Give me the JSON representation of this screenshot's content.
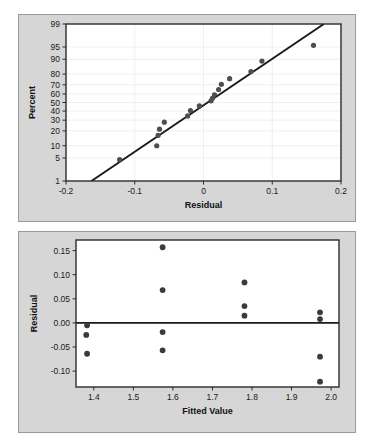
{
  "figure": {
    "background_color": "#ffffff",
    "panel_color": "#d6d6d6",
    "plot_color": "#ffffff",
    "point_color": "#4d4d53",
    "line_color": "#1a1a1a"
  },
  "chart_data": [
    {
      "type": "scatter",
      "id": "normal-probability-plot",
      "title": "",
      "xlabel": "Residual",
      "ylabel": "Percent",
      "xlim": [
        -0.2,
        0.2
      ],
      "ylim": [
        1,
        99
      ],
      "yscale": "normal-probability",
      "grid": true,
      "legend": "none",
      "xticks": [
        "-0.2",
        "-0.1",
        "0",
        "0.1",
        "0.2"
      ],
      "xtick_values": [
        -0.2,
        -0.1,
        0,
        0.1,
        0.2
      ],
      "yticks": [
        "99",
        "95",
        "90",
        "80",
        "70",
        "60",
        "50",
        "40",
        "30",
        "20",
        "10",
        "5",
        "1"
      ],
      "ytick_values": [
        99,
        95,
        90,
        80,
        70,
        60,
        50,
        40,
        30,
        20,
        10,
        5,
        1
      ],
      "reference_line": {
        "x1": -0.163,
        "y1": 1,
        "x2": 0.175,
        "y2": 99
      },
      "points": [
        {
          "x": -0.122,
          "y": 4.5
        },
        {
          "x": -0.068,
          "y": 10.0
        },
        {
          "x": -0.066,
          "y": 16.5
        },
        {
          "x": -0.064,
          "y": 21.5
        },
        {
          "x": -0.057,
          "y": 28.0
        },
        {
          "x": -0.023,
          "y": 34.5
        },
        {
          "x": -0.019,
          "y": 40.5
        },
        {
          "x": -0.006,
          "y": 46.0
        },
        {
          "x": 0.011,
          "y": 52.0
        },
        {
          "x": 0.013,
          "y": 55.0
        },
        {
          "x": 0.016,
          "y": 59.0
        },
        {
          "x": 0.022,
          "y": 65.0
        },
        {
          "x": 0.026,
          "y": 70.5
        },
        {
          "x": 0.038,
          "y": 76.0
        },
        {
          "x": 0.069,
          "y": 82.0
        },
        {
          "x": 0.085,
          "y": 89.0
        },
        {
          "x": 0.16,
          "y": 95.5
        }
      ]
    },
    {
      "type": "scatter",
      "id": "residuals-versus-fits-plot",
      "title": "",
      "xlabel": "Fitted Value",
      "ylabel": "Residual",
      "xlim": [
        1.355,
        2.02
      ],
      "ylim": [
        -0.133,
        0.172
      ],
      "grid": false,
      "legend": "none",
      "xticks": [
        "1.4",
        "1.5",
        "1.6",
        "1.7",
        "1.8",
        "1.9",
        "2.0"
      ],
      "xtick_values": [
        1.4,
        1.5,
        1.6,
        1.7,
        1.8,
        1.9,
        2.0
      ],
      "yticks": [
        "0.15",
        "0.10",
        "0.05",
        "0.00",
        "-0.05",
        "-0.10"
      ],
      "ytick_values": [
        0.15,
        0.1,
        0.05,
        0.0,
        -0.05,
        -0.1
      ],
      "reference_line": {
        "y": 0.0
      },
      "points": [
        {
          "x": 1.383,
          "y": -0.005
        },
        {
          "x": 1.381,
          "y": -0.025
        },
        {
          "x": 1.383,
          "y": -0.064
        },
        {
          "x": 1.574,
          "y": 0.157
        },
        {
          "x": 1.574,
          "y": 0.068
        },
        {
          "x": 1.574,
          "y": -0.019
        },
        {
          "x": 1.574,
          "y": -0.057
        },
        {
          "x": 1.781,
          "y": 0.084
        },
        {
          "x": 1.781,
          "y": 0.035
        },
        {
          "x": 1.781,
          "y": 0.015
        },
        {
          "x": 1.972,
          "y": 0.022
        },
        {
          "x": 1.972,
          "y": 0.008
        },
        {
          "x": 1.972,
          "y": -0.07
        },
        {
          "x": 1.972,
          "y": -0.122
        }
      ]
    }
  ]
}
